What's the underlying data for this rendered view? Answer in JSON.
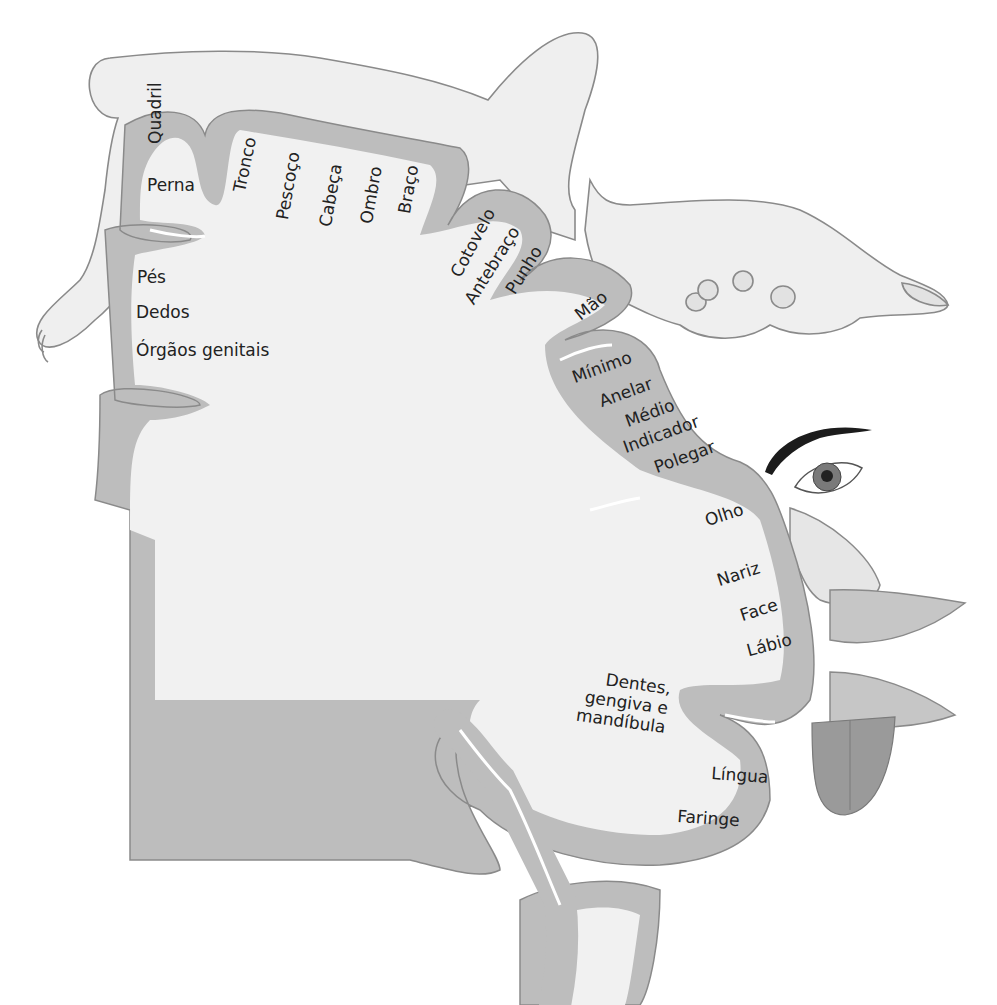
{
  "diagram": {
    "colors": {
      "background": "#ffffff",
      "cortex_fill": "#f1f1f1",
      "gray_matter": "#bdbdbd",
      "outline": "#8a8a8a",
      "skin": "#efefef",
      "eyebrow": "#1c1c1c",
      "iris": "#7a7a7a",
      "lips": "#c6c6c6",
      "tongue": "#9a9a9a",
      "text": "#222222"
    },
    "labels": [
      {
        "id": "quadril",
        "text": "Quadril"
      },
      {
        "id": "perna",
        "text": "Perna"
      },
      {
        "id": "tronco",
        "text": "Tronco"
      },
      {
        "id": "pescoco",
        "text": "Pescoço"
      },
      {
        "id": "cabeca",
        "text": "Cabeça"
      },
      {
        "id": "ombro",
        "text": "Ombro"
      },
      {
        "id": "braco",
        "text": "Braço"
      },
      {
        "id": "cotovelo",
        "text": "Cotovelo"
      },
      {
        "id": "antebraco",
        "text": "Antebraço"
      },
      {
        "id": "punho",
        "text": "Punho"
      },
      {
        "id": "mao",
        "text": "Mão"
      },
      {
        "id": "pes",
        "text": "Pés"
      },
      {
        "id": "dedos",
        "text": "Dedos"
      },
      {
        "id": "orgaos-genitais",
        "text": "Órgãos genitais"
      },
      {
        "id": "minimo",
        "text": "Mínimo"
      },
      {
        "id": "anelar",
        "text": "Anelar"
      },
      {
        "id": "medio",
        "text": "Médio"
      },
      {
        "id": "indicador",
        "text": "Indicador"
      },
      {
        "id": "polegar",
        "text": "Polegar"
      },
      {
        "id": "olho",
        "text": "Olho"
      },
      {
        "id": "nariz",
        "text": "Nariz"
      },
      {
        "id": "face",
        "text": "Face"
      },
      {
        "id": "labio",
        "text": "Lábio"
      },
      {
        "id": "dentes",
        "text": "Dentes,\ngengiva e\nmandíbula"
      },
      {
        "id": "lingua",
        "text": "Língua"
      },
      {
        "id": "faringe",
        "text": "Faringe"
      }
    ]
  }
}
